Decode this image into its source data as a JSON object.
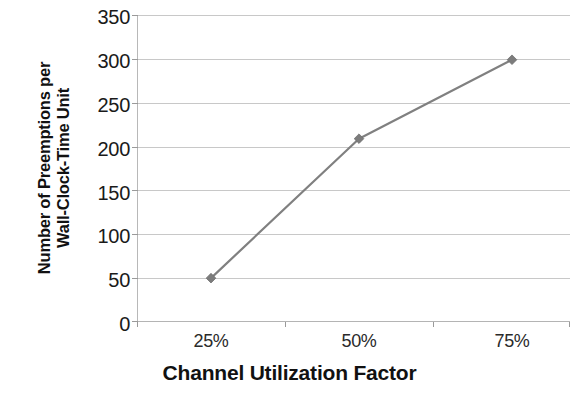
{
  "chart_data": {
    "type": "line",
    "title": "",
    "subtitle": "",
    "xlabel": "Channel Utilization Factor",
    "ylabel": "Number of Preemptions per Wall-Clock-Time Unit",
    "ylabel_lines": [
      "Number of Preemptions per",
      "Wall-Clock-Time Unit"
    ],
    "categories": [
      "25%",
      "50%",
      "75%"
    ],
    "x_tick_labels": [
      "25%",
      "50%",
      "75%"
    ],
    "values": [
      50,
      209,
      299
    ],
    "series": [
      {
        "name": "Number of Preemptions per Wall-Clock-Time Unit",
        "values": [
          50,
          209,
          299
        ],
        "color": "#808080",
        "marker": "diamond"
      }
    ],
    "ylim": [
      0,
      350
    ],
    "y_tick_values": [
      0,
      50,
      100,
      150,
      200,
      250,
      300,
      350
    ],
    "y_tick_labels": [
      "0",
      "50",
      "100",
      "150",
      "200",
      "250",
      "300",
      "350"
    ],
    "y_tick_interval": 50,
    "grid": true,
    "grid_axis": "y",
    "legend": false,
    "legend_position": "none",
    "line_color": "#808080",
    "gridline_color": "#c8c8c8",
    "background_color": "#ffffff",
    "text_color": "#111111"
  }
}
